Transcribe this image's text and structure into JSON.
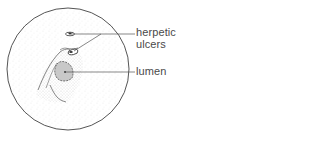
{
  "diagram": {
    "type": "endoscopic-view-illustration",
    "labels": {
      "ulcers_line1": "herpetic",
      "ulcers_line2": "ulcers",
      "lumen": "lumen"
    },
    "colors": {
      "outline": "#555555",
      "stipple": "#9a9a9a",
      "lumen_fill": "#c8c8c8",
      "text": "#4a4a4a"
    }
  }
}
